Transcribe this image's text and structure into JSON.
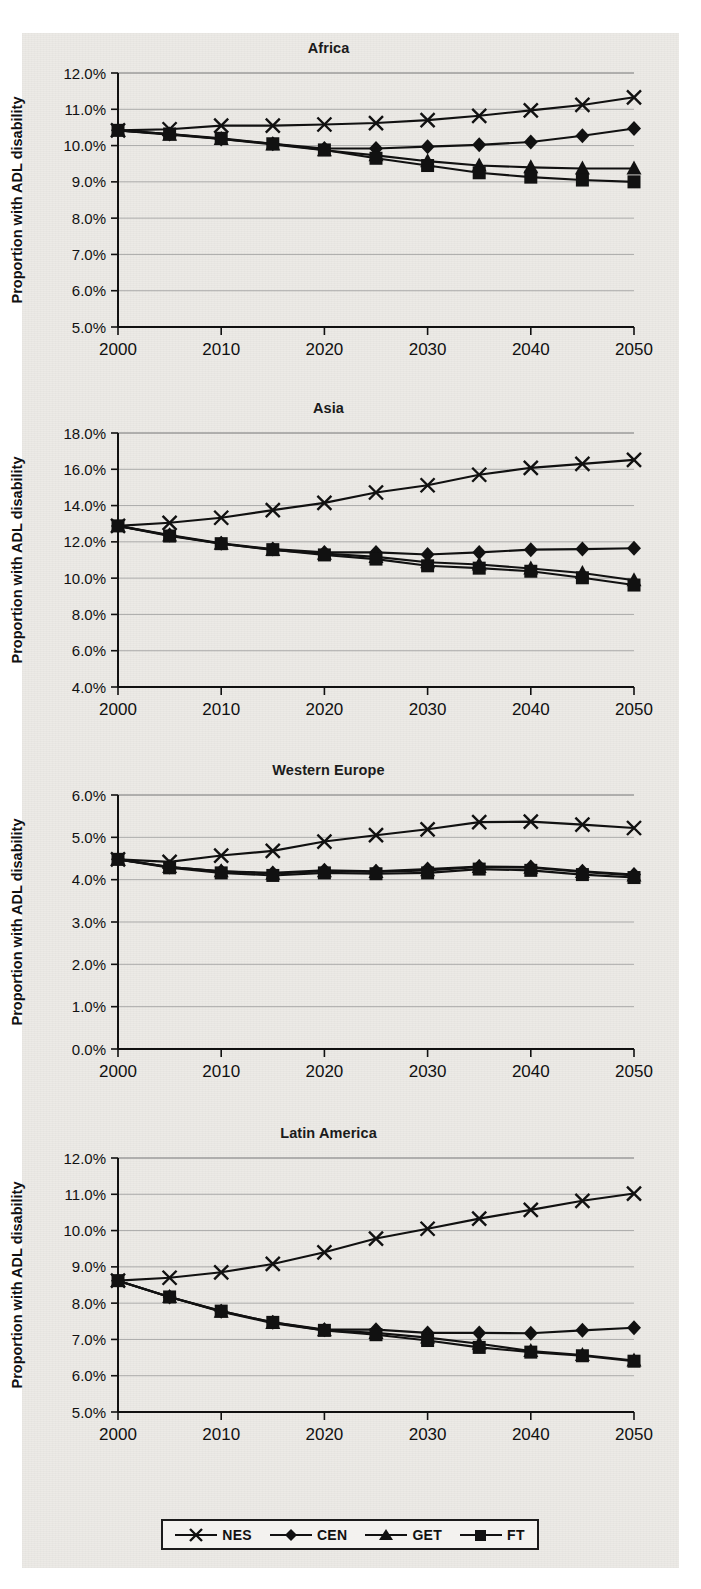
{
  "figure": {
    "axis_y_label": "Proportion with ADL disability",
    "x_tick_labels": [
      "2000",
      "2010",
      "2020",
      "2030",
      "2040",
      "2050"
    ],
    "legend": [
      {
        "label": "NES",
        "marker": "x-marker"
      },
      {
        "label": "CEN",
        "marker": "diamond-marker"
      },
      {
        "label": "GET",
        "marker": "triangle-marker"
      },
      {
        "label": "FT",
        "marker": "square-marker"
      }
    ]
  },
  "chart_data": [
    {
      "type": "line",
      "title": "Africa",
      "xlabel": "",
      "ylabel": "Proportion with ADL disability",
      "x": [
        2000,
        2005,
        2010,
        2015,
        2020,
        2025,
        2030,
        2035,
        2040,
        2045,
        2050
      ],
      "xlim": [
        2000,
        2050
      ],
      "ylim": [
        5.0,
        12.0
      ],
      "ytick_labels": [
        "12.0%",
        "11.0%",
        "10.0%",
        "9.0%",
        "8.0%",
        "7.0%",
        "6.0%",
        "5.0%"
      ],
      "ytick_values": [
        12.0,
        11.0,
        10.0,
        9.0,
        8.0,
        7.0,
        6.0,
        5.0
      ],
      "grid": true,
      "legend_position": "bottom",
      "series": [
        {
          "name": "NES",
          "marker": "x",
          "values": [
            10.42,
            10.45,
            10.55,
            10.55,
            10.58,
            10.62,
            10.7,
            10.82,
            10.97,
            11.12,
            11.33
          ]
        },
        {
          "name": "CEN",
          "marker": "diamond",
          "values": [
            10.42,
            10.32,
            10.18,
            10.05,
            9.92,
            9.92,
            9.97,
            10.02,
            10.1,
            10.27,
            10.47
          ]
        },
        {
          "name": "GET",
          "marker": "triangle",
          "values": [
            10.42,
            10.3,
            10.18,
            10.03,
            9.87,
            9.73,
            9.57,
            9.45,
            9.4,
            9.37,
            9.37
          ]
        },
        {
          "name": "FT",
          "marker": "square",
          "values": [
            10.42,
            10.32,
            10.2,
            10.05,
            9.88,
            9.65,
            9.45,
            9.25,
            9.13,
            9.05,
            9.0
          ]
        }
      ]
    },
    {
      "type": "line",
      "title": "Asia",
      "xlabel": "",
      "ylabel": "Proportion with ADL disability",
      "x": [
        2000,
        2005,
        2010,
        2015,
        2020,
        2025,
        2030,
        2035,
        2040,
        2045,
        2050
      ],
      "xlim": [
        2000,
        2050
      ],
      "ylim": [
        4.0,
        18.0
      ],
      "ytick_labels": [
        "18.0%",
        "16.0%",
        "14.0%",
        "12.0%",
        "10.0%",
        "8.0%",
        "6.0%",
        "4.0%"
      ],
      "ytick_values": [
        18.0,
        16.0,
        14.0,
        12.0,
        10.0,
        8.0,
        6.0,
        4.0
      ],
      "grid": true,
      "legend_position": "bottom",
      "series": [
        {
          "name": "NES",
          "marker": "x",
          "values": [
            12.88,
            13.05,
            13.33,
            13.75,
            14.15,
            14.72,
            15.12,
            15.7,
            16.08,
            16.3,
            16.52
          ]
        },
        {
          "name": "CEN",
          "marker": "diamond",
          "values": [
            12.88,
            12.38,
            11.92,
            11.6,
            11.42,
            11.42,
            11.3,
            11.42,
            11.57,
            11.6,
            11.65
          ]
        },
        {
          "name": "GET",
          "marker": "triangle",
          "values": [
            12.88,
            12.35,
            11.9,
            11.55,
            11.35,
            11.17,
            10.88,
            10.75,
            10.53,
            10.28,
            9.88
          ]
        },
        {
          "name": "FT",
          "marker": "square",
          "values": [
            12.88,
            12.32,
            11.9,
            11.57,
            11.28,
            11.05,
            10.68,
            10.55,
            10.38,
            10.02,
            9.62
          ]
        }
      ]
    },
    {
      "type": "line",
      "title": "Western Europe",
      "xlabel": "",
      "ylabel": "Proportion with ADL disability",
      "x": [
        2000,
        2005,
        2010,
        2015,
        2020,
        2025,
        2030,
        2035,
        2040,
        2045,
        2050
      ],
      "xlim": [
        2000,
        2050
      ],
      "ylim": [
        0.0,
        6.0
      ],
      "ytick_labels": [
        "6.0%",
        "5.0%",
        "4.0%",
        "3.0%",
        "2.0%",
        "1.0%",
        "0.0%"
      ],
      "ytick_values": [
        6.0,
        5.0,
        4.0,
        3.0,
        2.0,
        1.0,
        0.0
      ],
      "grid": true,
      "legend_position": "bottom",
      "series": [
        {
          "name": "NES",
          "marker": "x",
          "values": [
            4.48,
            4.42,
            4.57,
            4.68,
            4.9,
            5.05,
            5.19,
            5.36,
            5.37,
            5.3,
            5.22
          ]
        },
        {
          "name": "CEN",
          "marker": "diamond",
          "values": [
            4.48,
            4.3,
            4.2,
            4.16,
            4.22,
            4.2,
            4.25,
            4.31,
            4.3,
            4.2,
            4.12
          ]
        },
        {
          "name": "GET",
          "marker": "triangle",
          "values": [
            4.48,
            4.3,
            4.2,
            4.14,
            4.2,
            4.18,
            4.22,
            4.3,
            4.28,
            4.18,
            4.1
          ]
        },
        {
          "name": "FT",
          "marker": "square",
          "values": [
            4.48,
            4.28,
            4.16,
            4.1,
            4.16,
            4.14,
            4.16,
            4.25,
            4.22,
            4.12,
            4.05
          ]
        }
      ]
    },
    {
      "type": "line",
      "title": "Latin America",
      "xlabel": "",
      "ylabel": "Proportion with ADL disability",
      "x": [
        2000,
        2005,
        2010,
        2015,
        2020,
        2025,
        2030,
        2035,
        2040,
        2045,
        2050
      ],
      "xlim": [
        2000,
        2050
      ],
      "ylim": [
        5.0,
        12.0
      ],
      "ytick_labels": [
        "12.0%",
        "11.0%",
        "10.0%",
        "9.0%",
        "8.0%",
        "7.0%",
        "6.0%",
        "5.0%"
      ],
      "ytick_values": [
        12.0,
        11.0,
        10.0,
        9.0,
        8.0,
        7.0,
        6.0,
        5.0
      ],
      "grid": true,
      "legend_position": "bottom",
      "series": [
        {
          "name": "NES",
          "marker": "x",
          "values": [
            8.62,
            8.7,
            8.85,
            9.08,
            9.4,
            9.78,
            10.05,
            10.33,
            10.57,
            10.82,
            11.02
          ]
        },
        {
          "name": "CEN",
          "marker": "diamond",
          "values": [
            8.62,
            8.17,
            7.78,
            7.47,
            7.27,
            7.27,
            7.18,
            7.18,
            7.17,
            7.25,
            7.32
          ]
        },
        {
          "name": "GET",
          "marker": "triangle",
          "values": [
            8.62,
            8.17,
            7.76,
            7.45,
            7.25,
            7.18,
            7.05,
            6.88,
            6.68,
            6.57,
            6.42
          ]
        },
        {
          "name": "FT",
          "marker": "square",
          "values": [
            8.62,
            8.17,
            7.78,
            7.47,
            7.25,
            7.13,
            6.97,
            6.78,
            6.65,
            6.55,
            6.4
          ]
        }
      ]
    }
  ]
}
